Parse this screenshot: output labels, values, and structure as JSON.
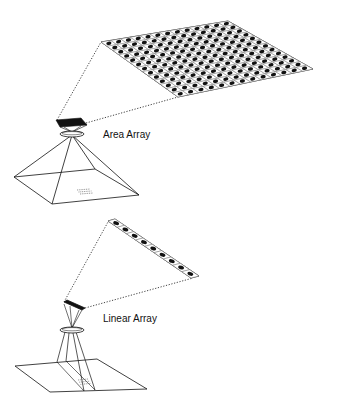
{
  "diagram": {
    "type": "illustration",
    "colors": {
      "line": "#111111",
      "fill_dark": "#111111",
      "background": "#ffffff",
      "cell_border": "#777777"
    },
    "area_array": {
      "label": "Area Array",
      "grid_rows": 13,
      "grid_cols": 13,
      "sensor_grid_corners": [
        [
          101,
          42
        ],
        [
          228,
          21
        ],
        [
          313,
          69
        ],
        [
          178,
          97
        ]
      ],
      "chip_corners": [
        [
          56,
          120
        ],
        [
          81,
          118
        ],
        [
          87,
          125
        ],
        [
          60,
          127
        ]
      ],
      "lens": {
        "cx": 72,
        "cy": 134,
        "rx": 12,
        "ry": 3
      },
      "base_corners": [
        [
          14,
          177
        ],
        [
          95,
          169
        ],
        [
          139,
          195
        ],
        [
          52,
          204
        ]
      ]
    },
    "linear_array": {
      "label": "Linear Array",
      "cells": 9,
      "strip_corners": [
        [
          108,
          221
        ],
        [
          115,
          219
        ],
        [
          199,
          276
        ],
        [
          191,
          278
        ]
      ],
      "chip_corners": [
        [
          64,
          302
        ],
        [
          67,
          300
        ],
        [
          85,
          308
        ],
        [
          82,
          310
        ]
      ],
      "lens": {
        "cx": 72,
        "cy": 330,
        "rx": 12,
        "ry": 3
      },
      "plane_corners": [
        [
          15,
          366
        ],
        [
          97,
          359
        ],
        [
          147,
          389
        ],
        [
          50,
          392
        ]
      ]
    }
  }
}
